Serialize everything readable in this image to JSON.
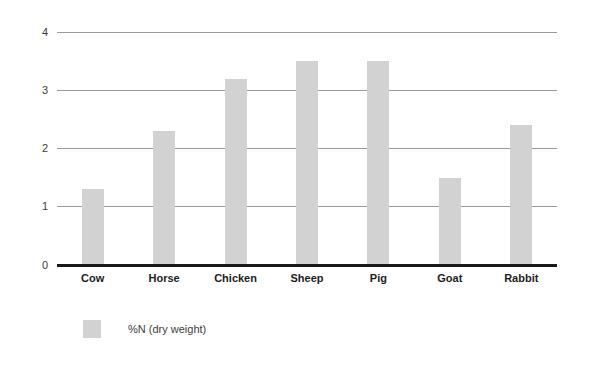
{
  "chart_data": {
    "type": "bar",
    "title": "",
    "subtitle": "",
    "xlabel": "",
    "ylabel": "",
    "categories": [
      "Cow",
      "Horse",
      "Chicken",
      "Sheep",
      "Pig",
      "Goat",
      "Rabbit"
    ],
    "values": [
      1.3,
      2.3,
      3.2,
      3.5,
      3.5,
      1.5,
      2.4
    ],
    "series": [
      {
        "name": "%N (dry weight)",
        "values": [
          1.3,
          2.3,
          3.2,
          3.5,
          3.5,
          1.5,
          2.4
        ]
      }
    ],
    "ylim": [
      0,
      4
    ],
    "yticks": [
      0,
      1,
      2,
      3,
      4
    ],
    "ytick_labels": [
      "0",
      "1",
      "2",
      "3",
      "4"
    ],
    "grid": true,
    "grid_axis": "y",
    "legend": [
      "%N (dry weight)"
    ],
    "legend_position": "bottom-left",
    "bar_color": "#d2d2d2",
    "gridline_color": "#9a9a9a",
    "baseline_color": "#1a1a1a",
    "tick_label_color": "#3c3c3c",
    "category_label_color": "#1d1d1d",
    "background_color": "#ffffff"
  },
  "legend": {
    "entries": [
      {
        "label": "%N (dry weight)",
        "swatch_color": "#d2d2d2"
      }
    ]
  }
}
